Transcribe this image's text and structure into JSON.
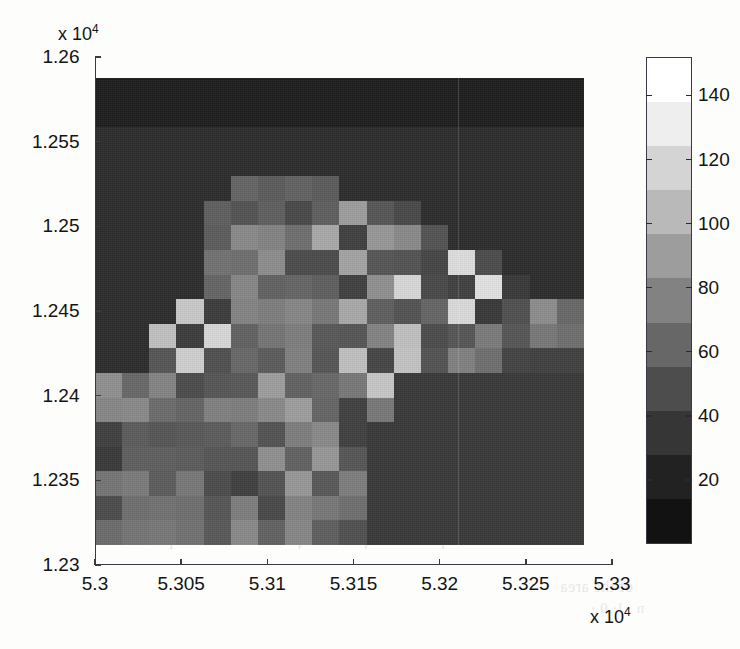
{
  "figure": {
    "background": "#fdfdfb",
    "axis_color": "#3a3a44",
    "text_color": "#141414"
  },
  "axes": {
    "x_exponent_label": "x 10",
    "x_exponent_sup": "4",
    "y_exponent_label": "x 10",
    "y_exponent_sup": "4",
    "x_ticks": [
      "5.3",
      "5.305",
      "5.31",
      "5.315",
      "5.32",
      "5.325",
      "5.33"
    ],
    "y_ticks": [
      "1.23",
      "1.235",
      "1.24",
      "1.245",
      "1.25",
      "1.255",
      "1.26"
    ]
  },
  "colorbar": {
    "ticks": [
      "20",
      "40",
      "60",
      "80",
      "100",
      "120",
      "140"
    ],
    "tick_values": [
      20,
      40,
      60,
      80,
      100,
      120,
      140
    ],
    "range": [
      0,
      152
    ],
    "colormap": "gray",
    "band_colors": [
      "#ffffff",
      "#eeeeee",
      "#d4d4d4",
      "#b9b9b9",
      "#9d9d9d",
      "#828282",
      "#676767",
      "#4d4d4d",
      "#363636",
      "#222222",
      "#121212"
    ]
  },
  "chart_data": {
    "type": "heatmap",
    "title": "",
    "xlabel": "",
    "ylabel": "",
    "xlim": [
      53000,
      53300
    ],
    "ylim": [
      12300,
      12600
    ],
    "x_tick_values": [
      53000,
      53050,
      53100,
      53150,
      53200,
      53250,
      53300
    ],
    "y_tick_values": [
      12300,
      12350,
      12400,
      12450,
      12500,
      12550,
      12600
    ],
    "x_exponent": 4,
    "y_exponent": 4,
    "grid": false,
    "colorbar_position": "right",
    "colormap": "gray",
    "vmin": 0,
    "vmax": 152,
    "nx": 18,
    "ny": 18,
    "x_cell_edges": [
      53007,
      53022,
      53038,
      53053,
      53069,
      53084,
      53100,
      53115,
      53131,
      53146,
      53162,
      53177,
      53193,
      53208,
      53224,
      53239,
      53255,
      53270,
      53286
    ],
    "y_cell_edges": [
      12317,
      12332,
      12347,
      12362,
      12377,
      12392,
      12408,
      12423,
      12438,
      12453,
      12468,
      12483,
      12498,
      12513,
      12528,
      12543,
      12558,
      12573,
      12588
    ],
    "note": "values are spatial density counts per cell; rows listed top (high y) to bottom (low y)",
    "values": [
      [
        6,
        6,
        6,
        6,
        6,
        6,
        6,
        6,
        6,
        6,
        6,
        6,
        6,
        6,
        6,
        6,
        6,
        6
      ],
      [
        6,
        6,
        6,
        6,
        6,
        6,
        6,
        6,
        6,
        6,
        6,
        6,
        6,
        6,
        6,
        6,
        6,
        6
      ],
      [
        14,
        14,
        14,
        14,
        14,
        14,
        14,
        14,
        14,
        14,
        14,
        14,
        14,
        14,
        14,
        14,
        14,
        14
      ],
      [
        14,
        14,
        14,
        14,
        14,
        14,
        14,
        14,
        14,
        14,
        14,
        14,
        14,
        14,
        14,
        14,
        14,
        14
      ],
      [
        14,
        14,
        14,
        14,
        14,
        50,
        44,
        48,
        44,
        14,
        14,
        14,
        14,
        14,
        14,
        14,
        14,
        14
      ],
      [
        14,
        14,
        14,
        14,
        46,
        38,
        46,
        32,
        46,
        88,
        40,
        32,
        14,
        14,
        14,
        14,
        14,
        14
      ],
      [
        14,
        14,
        14,
        14,
        44,
        74,
        70,
        56,
        96,
        26,
        84,
        74,
        38,
        14,
        14,
        14,
        14,
        14
      ],
      [
        14,
        14,
        14,
        14,
        58,
        56,
        76,
        34,
        34,
        92,
        40,
        38,
        30,
        132,
        34,
        14,
        14,
        14
      ],
      [
        14,
        14,
        14,
        14,
        50,
        72,
        48,
        50,
        46,
        26,
        78,
        128,
        32,
        26,
        136,
        22,
        14,
        14
      ],
      [
        14,
        14,
        14,
        118,
        24,
        70,
        66,
        72,
        62,
        96,
        46,
        38,
        50,
        130,
        22,
        36,
        76,
        52
      ],
      [
        14,
        14,
        112,
        24,
        128,
        48,
        60,
        66,
        42,
        40,
        70,
        112,
        34,
        40,
        64,
        40,
        62,
        56
      ],
      [
        14,
        14,
        40,
        122,
        36,
        52,
        44,
        68,
        40,
        112,
        30,
        114,
        38,
        68,
        56,
        28,
        26,
        26
      ],
      [
        78,
        52,
        70,
        34,
        40,
        42,
        88,
        48,
        52,
        62,
        116,
        22,
        22,
        22,
        22,
        22,
        22,
        22
      ],
      [
        72,
        74,
        54,
        50,
        68,
        66,
        74,
        88,
        50,
        26,
        62,
        22,
        22,
        22,
        22,
        22,
        22,
        22
      ],
      [
        26,
        44,
        40,
        42,
        44,
        52,
        38,
        66,
        74,
        26,
        22,
        22,
        22,
        22,
        22,
        22,
        22,
        22
      ],
      [
        22,
        46,
        46,
        44,
        40,
        40,
        78,
        48,
        84,
        40,
        22,
        22,
        22,
        22,
        22,
        22,
        22,
        22
      ],
      [
        60,
        64,
        44,
        62,
        34,
        26,
        38,
        84,
        42,
        66,
        22,
        22,
        22,
        22,
        22,
        22,
        22,
        22
      ],
      [
        34,
        56,
        58,
        56,
        40,
        66,
        32,
        70,
        62,
        56,
        22,
        22,
        22,
        22,
        22,
        22,
        22,
        22
      ],
      [
        54,
        60,
        62,
        58,
        42,
        74,
        48,
        72,
        46,
        36,
        22,
        22,
        22,
        22,
        22,
        22,
        22,
        22
      ]
    ]
  },
  "bleed_text": [
    {
      "text": "the parameter β be and β s the smaller depth",
      "x": 150,
      "y": 530,
      "size": 17
    },
    {
      "text": "of the area",
      "x": 560,
      "y": 578,
      "size": 16
    },
    {
      "text": "n · l· 0 ·",
      "x": 590,
      "y": 600,
      "size": 15
    }
  ]
}
